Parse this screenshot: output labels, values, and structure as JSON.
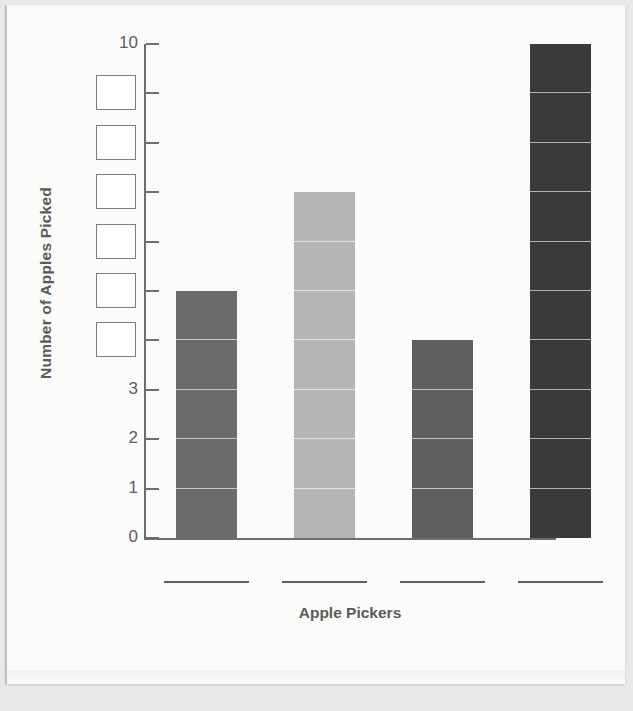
{
  "chart_data": {
    "type": "bar",
    "title": "",
    "xlabel": "Apple Pickers",
    "ylabel": "Number of Apples Picked",
    "categories": [
      "",
      "",
      "",
      ""
    ],
    "values": [
      5,
      7,
      4,
      10
    ],
    "ylim": [
      0,
      10
    ],
    "y_tick_values": [
      10,
      9,
      8,
      7,
      6,
      5,
      4,
      3,
      2,
      1,
      0
    ],
    "y_tick_labels": [
      "10",
      "",
      "",
      "",
      "",
      "",
      "",
      "3",
      "2",
      "1",
      "0"
    ],
    "y_blank_answer_boxes": [
      9,
      8,
      7,
      6,
      5,
      4
    ],
    "x_blank_answer_lines": 4,
    "grid": "segment-lines-inside-bars",
    "legend": "none",
    "bar_colors": [
      "#6b6b6b",
      "#b5b5b5",
      "#5f5f5f",
      "#3a3a3a"
    ],
    "bars": [
      {
        "index": 1,
        "value": 5,
        "color": "#6b6b6b",
        "label": ""
      },
      {
        "index": 2,
        "value": 7,
        "color": "#b5b5b5",
        "label": ""
      },
      {
        "index": 3,
        "value": 4,
        "color": "#5f5f5f",
        "label": ""
      },
      {
        "index": 4,
        "value": 10,
        "color": "#3a3a3a",
        "label": ""
      }
    ]
  },
  "axis": {
    "axis_color": "#6e6e6e",
    "label_color": "#5a5a5a",
    "tick_label_color": "#5d5d5d"
  },
  "page": {
    "background": "#e8e8e6",
    "sheet_background": "#fbfbfa"
  }
}
